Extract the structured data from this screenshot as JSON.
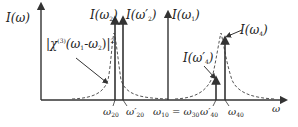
{
  "diagram": {
    "y_axis_label": {
      "main": "I(ω)"
    },
    "peaks": {
      "omega2": {
        "prefix": "I(ω",
        "sub": "2",
        "suffix": ")"
      },
      "omega2p": {
        "prefix": "I(ω′",
        "sub": "2",
        "suffix": ")"
      },
      "omega1": {
        "prefix": "I(ω",
        "sub": "1",
        "suffix": ")"
      },
      "omega4": {
        "prefix": "I(ω",
        "sub": "4",
        "suffix": ")"
      },
      "omega4p": {
        "prefix": "I(ω′",
        "sub": "4",
        "suffix": ")"
      }
    },
    "susceptibility": {
      "pre": "|χ",
      "sup": "(3)",
      "mid1": "(ω",
      "sub1": "1",
      "mid2": "-ω",
      "sub2": "2",
      "post": ")|",
      "sup2": "2"
    },
    "x_ticks": {
      "w20": {
        "main": "ω",
        "sub": "20"
      },
      "w20p": {
        "main": "ω′",
        "sub": "20"
      },
      "w10": {
        "main": "ω",
        "sub": "10"
      },
      "eq": "=",
      "w30": {
        "main": "ω",
        "sub": "30"
      },
      "w40p": {
        "main": "ω′",
        "sub": "40"
      },
      "w40": {
        "main": "ω",
        "sub": "40"
      }
    },
    "x_axis_label": "ω",
    "colors": {
      "line": "#333333",
      "dashed": "#555555"
    }
  }
}
